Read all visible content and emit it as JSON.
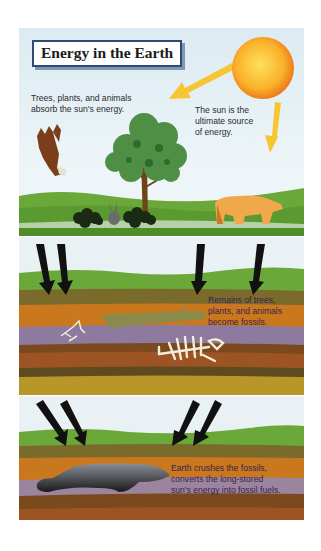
{
  "title": "Energy in the Earth",
  "panels": [
    {
      "id": "sunlight",
      "captions": {
        "absorb": [
          "Trees, plants, and animals",
          "absorb the sun's energy."
        ],
        "sun": [
          "The sun is the",
          "ultimate source",
          "of energy."
        ]
      },
      "elements": [
        "sun",
        "eagle",
        "tree",
        "bushes",
        "rabbit",
        "bear",
        "yellow-arrows"
      ]
    },
    {
      "id": "burial",
      "caption": [
        "Remains of trees,",
        "plants, and animals",
        "become fossils."
      ],
      "elements": [
        "black-arrows",
        "log-fossil",
        "small-skeleton",
        "animal-skeleton",
        "rock-layers"
      ]
    },
    {
      "id": "compression",
      "caption": [
        "Earth crushes the fossils,",
        "converts the long-stored",
        "sun's energy into fossil fuels."
      ],
      "elements": [
        "black-arrows",
        "fossil-fuel-deposit",
        "rock-layers"
      ]
    }
  ],
  "colors": {
    "sky": "#e3eff5",
    "sun": "#f7a21b",
    "grass": "#6aa83a",
    "olive_layer": "#7a6a2c",
    "orange_layer": "#c9781e",
    "purple_layer": "#8e7a9e",
    "brown_layer": "#7a4a1e",
    "rust_layer": "#9c5424",
    "mustard_layer": "#b8962a",
    "title_border": "#2f4a73"
  }
}
